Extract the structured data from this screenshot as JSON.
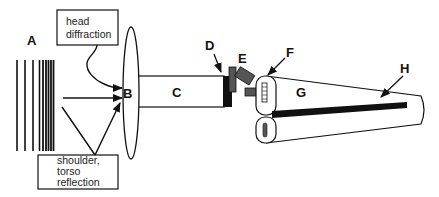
{
  "diagram": {
    "labels": {
      "A": "A",
      "B": "B",
      "C": "C",
      "D": "D",
      "E": "E",
      "F": "F",
      "G": "G",
      "H": "H"
    },
    "callouts": {
      "head_diffraction": [
        "head",
        "diffraction"
      ],
      "shoulder_torso": [
        "shoulder,",
        "torso",
        "reflection"
      ]
    },
    "colors": {
      "stroke": "#111111",
      "fill_dark": "#111111",
      "fill_gray": "#555555",
      "background": "#ffffff"
    }
  }
}
